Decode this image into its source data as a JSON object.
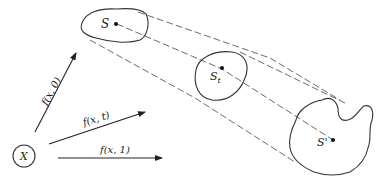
{
  "diagram": {
    "source_node": {
      "label": "X"
    },
    "arrows": [
      {
        "label": "f(x, 0)"
      },
      {
        "label": "f(x, t)"
      },
      {
        "label": "f(x, 1)"
      }
    ],
    "regions": [
      {
        "label": "S",
        "subscript": ""
      },
      {
        "label": "S",
        "subscript": "t"
      },
      {
        "label": "S'",
        "subscript": ""
      }
    ]
  }
}
